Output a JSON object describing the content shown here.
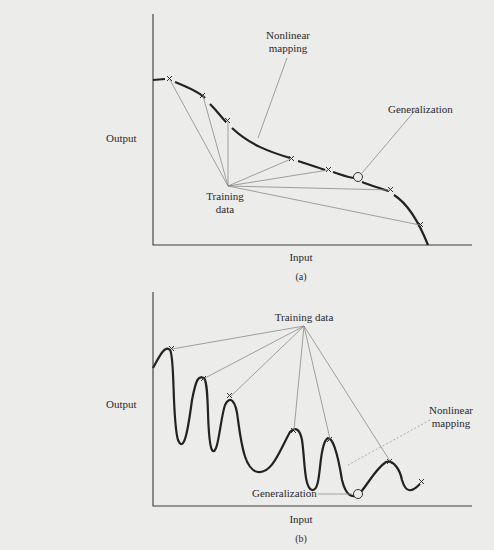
{
  "figure_a": {
    "labels": {
      "nonlinear_mapping_line1": "Nonlinear",
      "nonlinear_mapping_line2": "mapping",
      "generalization": "Generalization",
      "output": "Output",
      "training_line1": "Training",
      "training_line2": "data",
      "input": "Input"
    },
    "caption": "(a)"
  },
  "figure_b": {
    "labels": {
      "training_data": "Training data",
      "output": "Output",
      "nonlinear_mapping_line1": "Nonlinear",
      "nonlinear_mapping_line2": "mapping",
      "generalization": "Generalization",
      "input": "Input"
    },
    "caption": "(b)"
  },
  "colors": {
    "paper": "#ececea",
    "ink": "#222222",
    "leader_lines": "#8a8a8a"
  }
}
